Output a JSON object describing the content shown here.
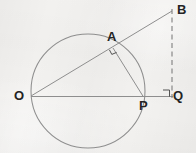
{
  "figure": {
    "kind": "geometry-diagram",
    "background_color": "#f3f2f0",
    "stroke_color": "#8a8a8a",
    "label_color": "#242424"
  },
  "labels": {
    "o": "O",
    "a": "A",
    "b": "B",
    "p": "P",
    "q": "Q"
  },
  "points": {
    "o": {
      "x": 31,
      "y": 96
    },
    "a": {
      "x": 113,
      "y": 48
    },
    "b": {
      "x": 172,
      "y": 11
    },
    "p": {
      "x": 143,
      "y": 97
    },
    "q": {
      "x": 172,
      "y": 97
    }
  },
  "circle": {
    "cx": 88,
    "cy": 91,
    "r": 57
  },
  "segments": [
    {
      "name": "o-to-b-secant",
      "from": "o",
      "to": "b",
      "style": "solid"
    },
    {
      "name": "o-to-q-baseline",
      "from": "o",
      "to": "q",
      "style": "solid"
    },
    {
      "name": "a-to-p-chord",
      "from": "a",
      "to": "p",
      "style": "solid"
    },
    {
      "name": "b-to-q-vertical",
      "from": "b",
      "to": "q",
      "style": "dashed"
    }
  ],
  "angle_marks": [
    {
      "name": "right-angle-at-a",
      "at": "a"
    },
    {
      "name": "right-angle-at-q",
      "at": "q"
    }
  ]
}
